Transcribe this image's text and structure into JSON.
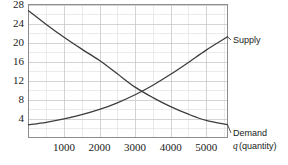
{
  "chart_data": {
    "type": "line",
    "title": "",
    "subtitle": "",
    "xlabel": "q (quantity)",
    "xlabel_variable": "q",
    "xlabel_rest": "(quantity)",
    "ylabel": "",
    "xlim": [
      0,
      5600
    ],
    "ylim": [
      0,
      28
    ],
    "grid": true,
    "grid_color": "#c9c9c9",
    "grid_minor_color": "#dddddd",
    "curve_color": "#3d3d3d",
    "legend_position": "right-inline",
    "x_ticks": [
      1000,
      2000,
      3000,
      4000,
      5000
    ],
    "x_tick_labels": [
      "1000",
      "2000",
      "3000",
      "4000",
      "5000"
    ],
    "x_minor_step": 500,
    "y_ticks": [
      4,
      8,
      12,
      16,
      20,
      24,
      28
    ],
    "y_tick_labels": [
      "4",
      "8",
      "12",
      "16",
      "20",
      "24",
      "28"
    ],
    "y_minor_step": 2,
    "equilibrium": {
      "q": 3100,
      "p": 10
    },
    "series": [
      {
        "name": "Supply",
        "label": "Supply",
        "x": [
          0,
          500,
          1000,
          1500,
          2000,
          2500,
          3000,
          3500,
          4000,
          4500,
          5000,
          5600
        ],
        "values": [
          2.7,
          3.2,
          3.9,
          4.8,
          5.9,
          7.3,
          9.0,
          11.0,
          13.3,
          15.8,
          18.4,
          21.2
        ]
      },
      {
        "name": "Demand",
        "label": "Demand",
        "x": [
          0,
          500,
          1000,
          1500,
          2000,
          2500,
          3000,
          3500,
          4000,
          4500,
          5000,
          5600
        ],
        "values": [
          26.7,
          23.8,
          21.1,
          18.6,
          16.2,
          13.4,
          10.6,
          8.4,
          6.5,
          4.9,
          3.6,
          2.7
        ]
      }
    ]
  },
  "labels": {
    "supply": "Supply",
    "demand": "Demand"
  }
}
